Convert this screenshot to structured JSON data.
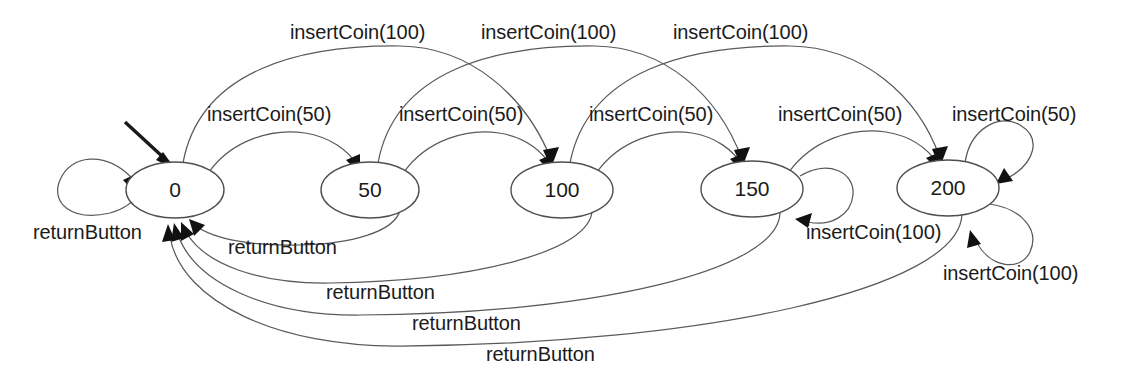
{
  "diagram": {
    "type": "finite-state-machine",
    "background_color": "#ffffff",
    "node_stroke_color": "#4f4f4f",
    "edge_stroke_color": "#5a5a5a",
    "text_color": "#1b1b1b",
    "states": [
      {
        "id": "s0",
        "label": "0",
        "cx": 175,
        "cy": 190,
        "rx": 49,
        "ry": 28
      },
      {
        "id": "s50",
        "label": "50",
        "cx": 370,
        "cy": 190,
        "rx": 49,
        "ry": 28
      },
      {
        "id": "s100",
        "label": "100",
        "cx": 562,
        "cy": 190,
        "rx": 51,
        "ry": 28
      },
      {
        "id": "s150",
        "label": "150",
        "cx": 752,
        "cy": 189,
        "rx": 51,
        "ry": 28
      },
      {
        "id": "s200",
        "label": "200",
        "cx": 948,
        "cy": 188,
        "rx": 51,
        "ry": 28
      }
    ],
    "initial_state": "s0",
    "transitions": [
      {
        "from": "s0",
        "to": "s50",
        "event": "insertCoin(50)"
      },
      {
        "from": "s50",
        "to": "s100",
        "event": "insertCoin(50)"
      },
      {
        "from": "s100",
        "to": "s150",
        "event": "insertCoin(50)"
      },
      {
        "from": "s150",
        "to": "s200",
        "event": "insertCoin(50)"
      },
      {
        "from": "s200",
        "to": "s200",
        "event": "insertCoin(50)"
      },
      {
        "from": "s0",
        "to": "s100",
        "event": "insertCoin(100)"
      },
      {
        "from": "s50",
        "to": "s150",
        "event": "insertCoin(100)"
      },
      {
        "from": "s100",
        "to": "s200",
        "event": "insertCoin(100)"
      },
      {
        "from": "s150",
        "to": "s150",
        "event": "insertCoin(100)"
      },
      {
        "from": "s200",
        "to": "s200",
        "event": "insertCoin(100)"
      },
      {
        "from": "s0",
        "to": "s0",
        "event": "returnButton"
      },
      {
        "from": "s50",
        "to": "s0",
        "event": "returnButton"
      },
      {
        "from": "s100",
        "to": "s0",
        "event": "returnButton"
      },
      {
        "from": "s150",
        "to": "s0",
        "event": "returnButton"
      },
      {
        "from": "s200",
        "to": "s0",
        "event": "returnButton"
      }
    ],
    "labels": {
      "top_insert_100_a": "insertCoin(100)",
      "top_insert_100_b": "insertCoin(100)",
      "top_insert_100_c": "insertCoin(100)",
      "mid_insert_50_a": "insertCoin(50)",
      "mid_insert_50_b": "insertCoin(50)",
      "mid_insert_50_c": "insertCoin(50)",
      "mid_insert_50_d": "insertCoin(50)",
      "loop200_insert_50": "insertCoin(50)",
      "loop150_insert_100": "insertCoin(100)",
      "loop200_insert_100": "insertCoin(100)",
      "loop0_return": "returnButton",
      "return_a": "returnButton",
      "return_b": "returnButton",
      "return_c": "returnButton",
      "return_d": "returnButton"
    }
  }
}
